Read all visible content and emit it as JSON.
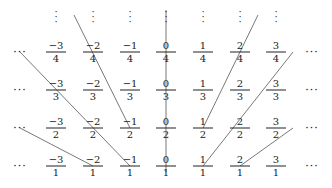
{
  "diagram": {
    "columns_x": [
      56,
      93,
      130,
      166,
      203,
      240,
      276
    ],
    "rows_y": [
      52,
      90,
      128,
      166
    ],
    "numerators": [
      -3,
      -2,
      -1,
      0,
      1,
      2,
      3
    ],
    "denominators": [
      4,
      3,
      2,
      1
    ],
    "ellipsis_h": "···",
    "ellipsis_v": "⋮",
    "grid": [
      [
        {
          "n": "−3",
          "d": "4"
        },
        {
          "n": "−2",
          "d": "4"
        },
        {
          "n": "−1",
          "d": "4"
        },
        {
          "n": "0",
          "d": "4"
        },
        {
          "n": "1",
          "d": "4"
        },
        {
          "n": "2",
          "d": "4"
        },
        {
          "n": "3",
          "d": "4"
        }
      ],
      [
        {
          "n": "−3",
          "d": "3"
        },
        {
          "n": "−2",
          "d": "3"
        },
        {
          "n": "−1",
          "d": "3"
        },
        {
          "n": "0",
          "d": "3"
        },
        {
          "n": "1",
          "d": "3"
        },
        {
          "n": "2",
          "d": "3"
        },
        {
          "n": "3",
          "d": "3"
        }
      ],
      [
        {
          "n": "−3",
          "d": "2"
        },
        {
          "n": "−2",
          "d": "2"
        },
        {
          "n": "−1",
          "d": "2"
        },
        {
          "n": "0",
          "d": "2"
        },
        {
          "n": "1",
          "d": "2"
        },
        {
          "n": "2",
          "d": "2"
        },
        {
          "n": "3",
          "d": "2"
        }
      ],
      [
        {
          "n": "−3",
          "d": "1"
        },
        {
          "n": "−2",
          "d": "1"
        },
        {
          "n": "−1",
          "d": "1"
        },
        {
          "n": "0",
          "d": "1"
        },
        {
          "n": "1",
          "d": "1"
        },
        {
          "n": "2",
          "d": "1"
        },
        {
          "n": "3",
          "d": "1"
        }
      ]
    ],
    "lines": [
      {
        "x1": 20,
        "y1": 52,
        "x2": 130,
        "y2": 166
      },
      {
        "x1": 74,
        "y1": 15,
        "x2": 130,
        "y2": 128
      },
      {
        "x1": 20,
        "y1": 128,
        "x2": 93,
        "y2": 166
      },
      {
        "x1": 166,
        "y1": 10,
        "x2": 166,
        "y2": 172
      },
      {
        "x1": 258,
        "y1": 15,
        "x2": 203,
        "y2": 128
      },
      {
        "x1": 293,
        "y1": 52,
        "x2": 203,
        "y2": 166
      },
      {
        "x1": 293,
        "y1": 128,
        "x2": 240,
        "y2": 166
      }
    ],
    "line_color": "#555555"
  }
}
